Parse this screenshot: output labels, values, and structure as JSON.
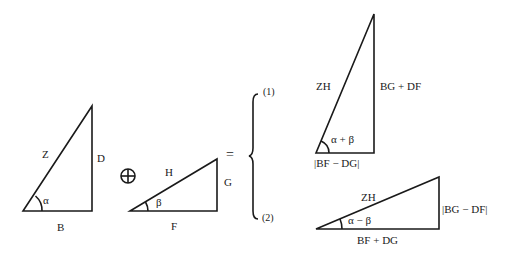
{
  "diagram": {
    "title": "",
    "operator_combine": "⊕",
    "operator_equals": "=",
    "triangle_1": {
      "hypotenuse": "Z",
      "opposite": "D",
      "adjacent": "B",
      "angle": "α"
    },
    "triangle_2": {
      "hypotenuse": "H",
      "opposite": "G",
      "adjacent": "F",
      "angle": "β"
    },
    "result_1": {
      "case_label": "(1)",
      "hypotenuse": "ZH",
      "opposite": "BG + DF",
      "adjacent": "|BF − DG|",
      "angle": "α + β"
    },
    "result_2": {
      "case_label": "(2)",
      "hypotenuse": "ZH",
      "opposite": "|BG − DF|",
      "adjacent": "BF + DG",
      "angle": "α − β"
    }
  }
}
